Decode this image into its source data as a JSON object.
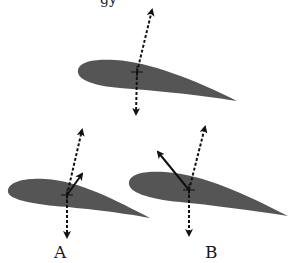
{
  "diagram": {
    "top_text_fragment": "gy",
    "airfoil_color": "#555555",
    "arrow_color": "#111111",
    "airfoils": [
      {
        "id": "top",
        "label": ""
      },
      {
        "id": "a",
        "label": "A"
      },
      {
        "id": "b",
        "label": "B"
      }
    ]
  }
}
